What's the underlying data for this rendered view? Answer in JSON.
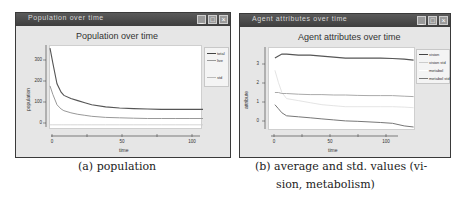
{
  "windows": [
    {
      "title": "Population over time",
      "buttons": [
        "minimize",
        "maximize",
        "close"
      ]
    },
    {
      "title": "Agent attributes over time",
      "buttons": [
        "minimize",
        "maximize",
        "close"
      ]
    }
  ],
  "captions": {
    "a": "(a) population",
    "b_line1": "(b) average and std. values (vi-",
    "b_line2": "sion, metabolism)"
  },
  "colors": {
    "titlebar": "#444444",
    "window_bg": "#e6e6e6",
    "plot_bg": "#ffffff",
    "series_dark": "#555555",
    "series_light": "#999999",
    "series_faint": "#cccccc"
  },
  "chart_data": [
    {
      "type": "line",
      "title": "Population over time",
      "xlabel": "time",
      "ylabel": "population",
      "xlim": [
        0,
        110
      ],
      "ylim": [
        -20,
        380
      ],
      "xticks": [
        "0",
        "50",
        "100"
      ],
      "yticks": [
        "0",
        "100",
        "200",
        "300"
      ],
      "grid": false,
      "legend_position": "right",
      "legend": [
        "total",
        "live",
        "",
        "std"
      ],
      "x": [
        0,
        2,
        5,
        8,
        10,
        15,
        20,
        25,
        30,
        40,
        50,
        60,
        70,
        80,
        90,
        100,
        110
      ],
      "series": [
        {
          "name": "total",
          "values": [
            370,
            300,
            200,
            160,
            145,
            130,
            120,
            110,
            100,
            90,
            85,
            82,
            80,
            78,
            78,
            78,
            78
          ]
        },
        {
          "name": "live",
          "values": [
            190,
            150,
            100,
            80,
            72,
            62,
            55,
            50,
            45,
            40,
            38,
            36,
            35,
            35,
            35,
            35,
            35
          ]
        },
        {
          "name": "std",
          "values": [
            5,
            5,
            5,
            5,
            5,
            5,
            5,
            5,
            5,
            5,
            5,
            5,
            5,
            5,
            5,
            5,
            5
          ]
        }
      ]
    },
    {
      "type": "line",
      "title": "Agent attributes over time",
      "xlabel": "time",
      "ylabel": "attribute",
      "xlim": [
        -5,
        120
      ],
      "ylim": [
        -0.2,
        3.9
      ],
      "xticks": [
        "0",
        "50",
        "100"
      ],
      "yticks": [
        "0",
        "1",
        "2",
        "3"
      ],
      "grid": false,
      "legend_position": "right",
      "legend": [
        "vision",
        "vision std",
        "metabol",
        "metabol std"
      ],
      "x": [
        0,
        3,
        6,
        10,
        20,
        30,
        40,
        50,
        60,
        70,
        80,
        90,
        100,
        110,
        118
      ],
      "series": [
        {
          "name": "vision",
          "values": [
            3.4,
            3.5,
            3.6,
            3.6,
            3.55,
            3.55,
            3.5,
            3.45,
            3.4,
            3.4,
            3.4,
            3.4,
            3.38,
            3.35,
            3.3
          ]
        },
        {
          "name": "vision std",
          "values": [
            2.8,
            2.2,
            1.7,
            1.4,
            1.3,
            1.2,
            1.1,
            1.05,
            1.0,
            1.0,
            1.0,
            1.0,
            1.0,
            0.98,
            0.95
          ]
        },
        {
          "name": "metabol",
          "values": [
            1.7,
            1.7,
            1.65,
            1.65,
            1.62,
            1.6,
            1.6,
            1.58,
            1.58,
            1.56,
            1.55,
            1.55,
            1.55,
            1.52,
            1.5
          ]
        },
        {
          "name": "metabol std",
          "values": [
            1.1,
            0.9,
            0.7,
            0.55,
            0.5,
            0.45,
            0.4,
            0.35,
            0.3,
            0.28,
            0.25,
            0.22,
            0.18,
            0.05,
            0.0
          ]
        }
      ]
    }
  ]
}
